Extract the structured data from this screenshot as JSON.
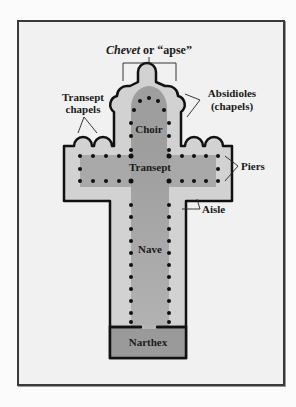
{
  "diagram": {
    "title_italic": "Chevet",
    "title_rest": " or “apse”",
    "labels": {
      "transept_chapels_1": "Transept",
      "transept_chapels_2": "chapels",
      "absidioles_1": "Absidioles",
      "absidioles_2": "(chapels)",
      "choir": "Choir",
      "transept": "Transept",
      "piers": "Piers",
      "aisle": "Aisle",
      "nave": "Nave",
      "narthex": "Narthex"
    },
    "colors": {
      "frame_bg": "#f1f1f1",
      "aisle_fill": "#cfcfcf",
      "nave_fill": "#a9a9a9",
      "narthex_fill": "#9a9a9a",
      "outline": "#111111",
      "pier": "#111111"
    }
  }
}
